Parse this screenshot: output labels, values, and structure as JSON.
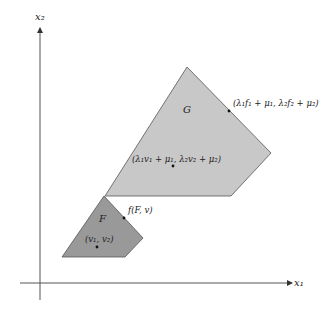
{
  "axes": {
    "x_label": "x₁",
    "y_label": "x₂"
  },
  "regions": {
    "G": {
      "label": "G",
      "fill": "#c8c8c8"
    },
    "F": {
      "label": "F",
      "fill": "#999999"
    }
  },
  "points": {
    "g_boundary": "(λ₁f₁ + μ₁, λ₂f₂ + μ₂)",
    "g_interior": "(λ₁v₁ + μ₁, λ₂v₂ + μ₂)",
    "f_boundary": "f(F, v)",
    "f_interior": "(v₁, v₂)"
  }
}
